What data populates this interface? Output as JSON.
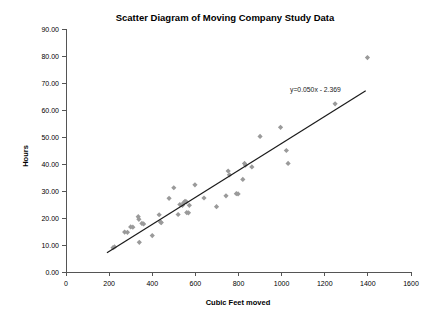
{
  "chart_data": {
    "type": "scatter",
    "title": "Scatter Diagram of Moving Company Study Data",
    "xlabel": "Cubic Feet moved",
    "ylabel": "Hours",
    "xlim": [
      0,
      1600
    ],
    "ylim": [
      0,
      90
    ],
    "xticks": [
      0,
      200,
      400,
      600,
      800,
      1000,
      1200,
      1400,
      1600
    ],
    "xtick_labels": [
      "0",
      "200",
      "400",
      "600",
      "800",
      "1000",
      "1200",
      "1400",
      "1600"
    ],
    "yticks": [
      0,
      10,
      20,
      30,
      40,
      50,
      60,
      70,
      80,
      90
    ],
    "ytick_labels": [
      "0.00",
      "10.00",
      "20.00",
      "30.00",
      "40.00",
      "50.00",
      "60.00",
      "70.00",
      "80.00",
      "90.00"
    ],
    "grid": false,
    "legend": false,
    "marker_shape": "diamond",
    "marker_color": "#9a9a9a",
    "series": [
      {
        "name": "Moving jobs",
        "points": [
          [
            218,
            9.0
          ],
          [
            225,
            9.3
          ],
          [
            272,
            14.8
          ],
          [
            285,
            14.7
          ],
          [
            300,
            16.7
          ],
          [
            310,
            16.6
          ],
          [
            335,
            20.5
          ],
          [
            338,
            19.5
          ],
          [
            340,
            11.0
          ],
          [
            352,
            18.0
          ],
          [
            360,
            17.8
          ],
          [
            400,
            13.5
          ],
          [
            432,
            21.2
          ],
          [
            438,
            18.5
          ],
          [
            442,
            18.3
          ],
          [
            478,
            27.3
          ],
          [
            500,
            31.2
          ],
          [
            520,
            21.3
          ],
          [
            528,
            25.0
          ],
          [
            540,
            24.7
          ],
          [
            545,
            25.6
          ],
          [
            552,
            26.2
          ],
          [
            558,
            26.0
          ],
          [
            560,
            22.0
          ],
          [
            568,
            21.9
          ],
          [
            572,
            24.7
          ],
          [
            598,
            32.3
          ],
          [
            640,
            27.4
          ],
          [
            698,
            24.2
          ],
          [
            742,
            28.2
          ],
          [
            752,
            37.4
          ],
          [
            758,
            36.0
          ],
          [
            790,
            29.0
          ],
          [
            798,
            28.9
          ],
          [
            820,
            34.3
          ],
          [
            828,
            40.2
          ],
          [
            832,
            39.6
          ],
          [
            862,
            38.9
          ],
          [
            900,
            50.2
          ],
          [
            995,
            53.6
          ],
          [
            1022,
            45.0
          ],
          [
            1030,
            40.2
          ],
          [
            1248,
            62.3
          ],
          [
            1398,
            79.4
          ]
        ]
      }
    ],
    "trend_line": {
      "equation_label": "y=0.050x - 2.369",
      "slope": 0.05,
      "intercept": -2.369,
      "x_start": 190,
      "x_end": 1390
    }
  }
}
